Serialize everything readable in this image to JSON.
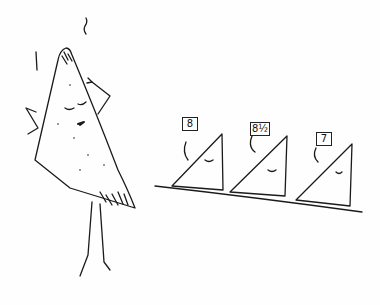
{
  "illustration": {
    "style": "hand-drawn ink cartoon",
    "ink_color": "#1a1a1a",
    "background": "#fefefe",
    "main_character": "tortilla chip doing a pose, eyes closed",
    "judges": [
      {
        "score": "8"
      },
      {
        "score": "8½"
      },
      {
        "score": "7"
      }
    ]
  }
}
